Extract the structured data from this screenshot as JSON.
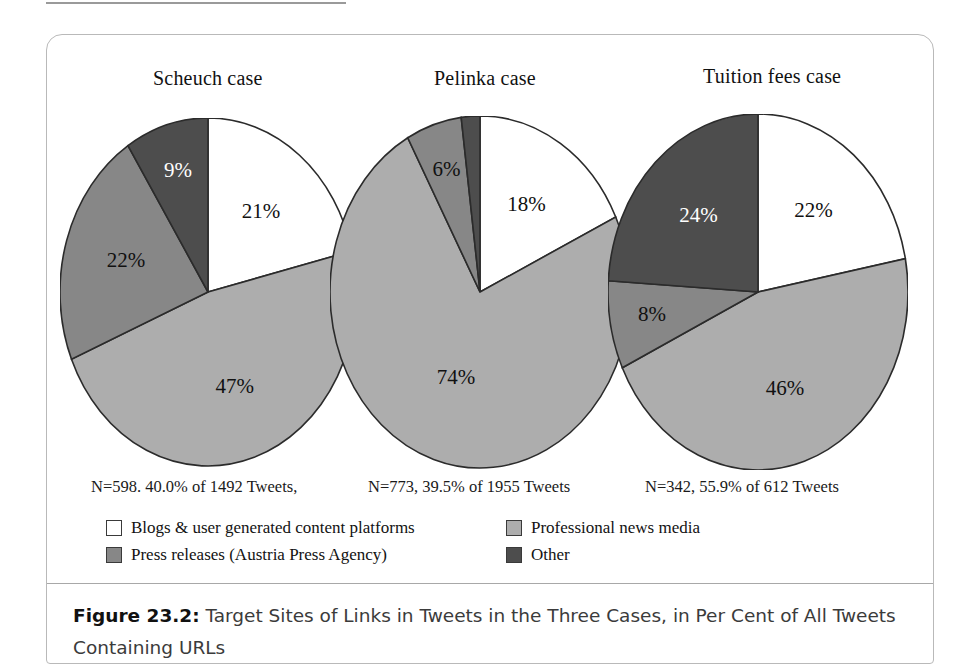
{
  "figure": {
    "caption_label": "Figure 23.2:",
    "caption_text": " Target Sites of Links in Tweets in the Three Cases, in Per Cent of All Tweets Containing URLs"
  },
  "colors": {
    "blogs": "#ffffff",
    "professional_news": "#adadad",
    "press_releases": "#878787",
    "other": "#4d4d4d",
    "outline": "#2b2b2b",
    "frame_border": "#b9b9b9",
    "rule": "#a8a8a8"
  },
  "legend": {
    "items": [
      {
        "label": "Blogs & user generated content platforms",
        "color": "#ffffff",
        "key": "blogs"
      },
      {
        "label": "Professional news media",
        "color": "#adadad",
        "key": "professional_news"
      },
      {
        "label": "Press releases (Austria Press Agency)",
        "color": "#878787",
        "key": "press_releases"
      },
      {
        "label": "Other",
        "color": "#4d4d4d",
        "key": "other"
      }
    ]
  },
  "chart_data": {
    "type": "pie",
    "title": "Target Sites of Links in Tweets in the Three Cases, in Per Cent of All Tweets Containing URLs",
    "categories": [
      "Blogs & user generated content platforms",
      "Professional news media",
      "Press releases (Austria Press Agency)",
      "Other"
    ],
    "colors": [
      "#ffffff",
      "#adadad",
      "#878787",
      "#4d4d4d"
    ],
    "units": "per cent",
    "legend_position": "bottom",
    "charts": [
      {
        "title": "Scheuch case",
        "note": "N=598. 40.0% of 1492 Tweets,",
        "n": 598,
        "share_of_tweets_pct": 40.0,
        "total_tweets": 1492,
        "values": [
          21,
          47,
          22,
          9
        ],
        "labels": [
          "21%",
          "47%",
          "22%",
          "9%"
        ]
      },
      {
        "title": "Pelinka case",
        "note": "N=773, 39.5% of 1955 Tweets",
        "n": 773,
        "share_of_tweets_pct": 39.5,
        "total_tweets": 1955,
        "values": [
          18,
          74,
          6,
          2
        ],
        "labels": [
          "18%",
          "74%",
          "6%",
          ""
        ]
      },
      {
        "title": "Tuition fees case",
        "note": "N=342, 55.9% of 612 Tweets",
        "n": 342,
        "share_of_tweets_pct": 55.9,
        "total_tweets": 612,
        "values": [
          22,
          46,
          8,
          24
        ],
        "labels": [
          "22%",
          "46%",
          "8%",
          "24%"
        ]
      }
    ]
  }
}
